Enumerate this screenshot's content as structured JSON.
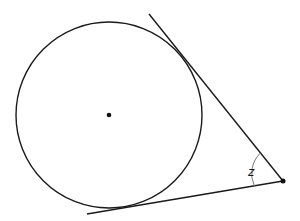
{
  "figure": {
    "circle": {
      "cx": 109,
      "cy": 115,
      "r": 93
    },
    "center_point": {
      "x": 109,
      "y": 115
    },
    "external_point": {
      "x": 283,
      "y": 181
    },
    "tangent_upper": {
      "x1": 149,
      "y1": 14,
      "x2": 283,
      "y2": 181
    },
    "tangent_lower": {
      "x1": 87,
      "y1": 214,
      "x2": 283,
      "y2": 181
    },
    "angle_label": "z",
    "colors": {
      "stroke": "#1a1a1a",
      "arc": "#777777",
      "background": "#ffffff"
    }
  }
}
